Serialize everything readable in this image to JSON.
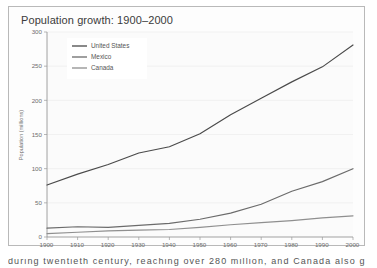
{
  "figure": {
    "title": "Population growth: 1900–2000",
    "watermark": "",
    "frame_color": "#b9b9b9",
    "background": "#fdfdfd"
  },
  "caption": {
    "clipped_text": "during twentieth century, reaching over 280 million, and Canada also grew"
  },
  "chart_data": {
    "type": "line",
    "title": "Population growth: 1900–2000",
    "xlabel": "",
    "ylabel": "Population (millions)",
    "x": [
      1900,
      1910,
      1920,
      1930,
      1940,
      1950,
      1960,
      1970,
      1980,
      1990,
      2000
    ],
    "xlim": [
      1900,
      2000
    ],
    "ylim": [
      0,
      300
    ],
    "xticks": [
      "1900",
      "1910",
      "1920",
      "1930",
      "1940",
      "1950",
      "1960",
      "1970",
      "1980",
      "1990",
      "2000"
    ],
    "yticks": [
      "0",
      "50",
      "100",
      "150",
      "200",
      "250",
      "300"
    ],
    "grid": true,
    "legend_position": "top-left",
    "series": [
      {
        "name": "United States",
        "color": "#4a4a4a",
        "values": [
          76,
          92,
          106,
          123,
          132,
          151,
          179,
          203,
          227,
          249,
          281
        ]
      },
      {
        "name": "Mexico",
        "color": "#6b6b6b",
        "values": [
          13,
          15,
          14,
          17,
          20,
          26,
          35,
          48,
          67,
          81,
          100
        ]
      },
      {
        "name": "Canada",
        "color": "#8f8f8f",
        "values": [
          5,
          7,
          9,
          10,
          11,
          14,
          18,
          21,
          24,
          28,
          31
        ]
      }
    ]
  }
}
